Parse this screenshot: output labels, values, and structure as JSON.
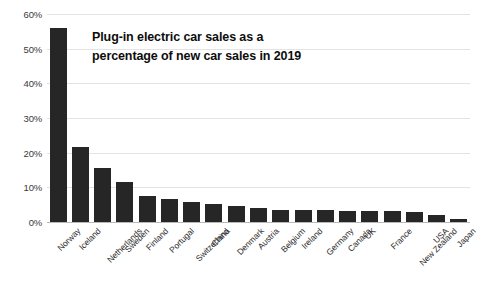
{
  "chart_data": {
    "type": "bar",
    "title": "Plug-in electric car sales as a percentage of new car sales in 2019",
    "title_line1": "Plug-in electric car sales as a",
    "title_line2": "percentage of new car sales in 2019",
    "xlabel": "",
    "ylabel": "",
    "ylim": [
      0,
      60
    ],
    "ytick_labels": [
      "60%",
      "50%",
      "40%",
      "30%",
      "20%",
      "10%",
      "0%"
    ],
    "ytick_values": [
      60,
      50,
      40,
      30,
      20,
      10,
      0
    ],
    "grid": true,
    "legend": "none",
    "bar_color": "#262626",
    "gridline_color": "#e3e3e3",
    "categories": [
      "Norway",
      "Iceland",
      "Netherlands",
      "Sweden",
      "Finland",
      "Portugal",
      "Switzerland",
      "China",
      "Denmark",
      "Austria",
      "Belgium",
      "Ireland",
      "Germany",
      "Canada",
      "UK",
      "France",
      "New Zealand",
      "USA",
      "Japan"
    ],
    "values": [
      56.0,
      21.5,
      15.5,
      11.5,
      7.5,
      6.5,
      5.7,
      5.2,
      4.5,
      3.9,
      3.6,
      3.5,
      3.4,
      3.3,
      3.2,
      3.1,
      3.0,
      2.0,
      0.8
    ]
  }
}
